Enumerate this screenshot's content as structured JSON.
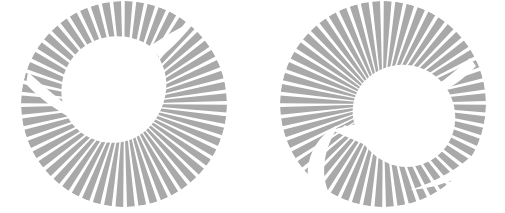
{
  "page": {
    "background_color": "#ffffff",
    "width": 505,
    "height": 213
  },
  "palette": {
    "stripe_gray": "#a9a9a9",
    "stripe_gray_light": "#b4b4b4",
    "background": "#ffffff",
    "eye": "#ffffff"
  },
  "chart_data": {
    "type": "scatter",
    "xlabel": "",
    "ylabel": "",
    "figures": [
      {
        "name": "left-kiwi-logo",
        "orientation": "bird-facing-right",
        "center": [
          124,
          104
        ],
        "outer_radius": 103,
        "inner_radius": 6,
        "spoke_count": 56,
        "spoke_gap_deg": 2.1,
        "stripe_color": "#a9a9a9",
        "eye": {
          "cx": 157,
          "cy": 76,
          "r": 1.8
        },
        "start_angle_deg": -96,
        "sweep_deg": 360
      },
      {
        "name": "right-kiwi-logo",
        "orientation": "bird-facing-left",
        "center": [
          383,
          104
        ],
        "outer_radius": 103,
        "inner_radius": 6,
        "spoke_count": 56,
        "spoke_gap_deg": 2.1,
        "stripe_color": "#a9a9a9",
        "eye": {
          "cx": 345,
          "cy": 127,
          "r": 1.8
        },
        "start_angle_deg": -96,
        "sweep_deg": 360
      }
    ]
  },
  "figures": {
    "left": {
      "label": "Kiwi logo left",
      "center_x": 124,
      "center_y": 104,
      "radius": 103,
      "spokes": 56,
      "color": "#a9a9a9",
      "eye_x": 157,
      "eye_y": 76
    },
    "right": {
      "label": "Kiwi logo right",
      "center_x": 383,
      "center_y": 104,
      "radius": 103,
      "spokes": 56,
      "color": "#a9a9a9",
      "eye_x": 345,
      "eye_y": 127
    }
  },
  "alt_text": {
    "left": "Circular radial stripe emblem forming a kiwi bird silhouette facing right",
    "right": "Circular radial stripe emblem forming a kiwi bird silhouette facing left"
  }
}
